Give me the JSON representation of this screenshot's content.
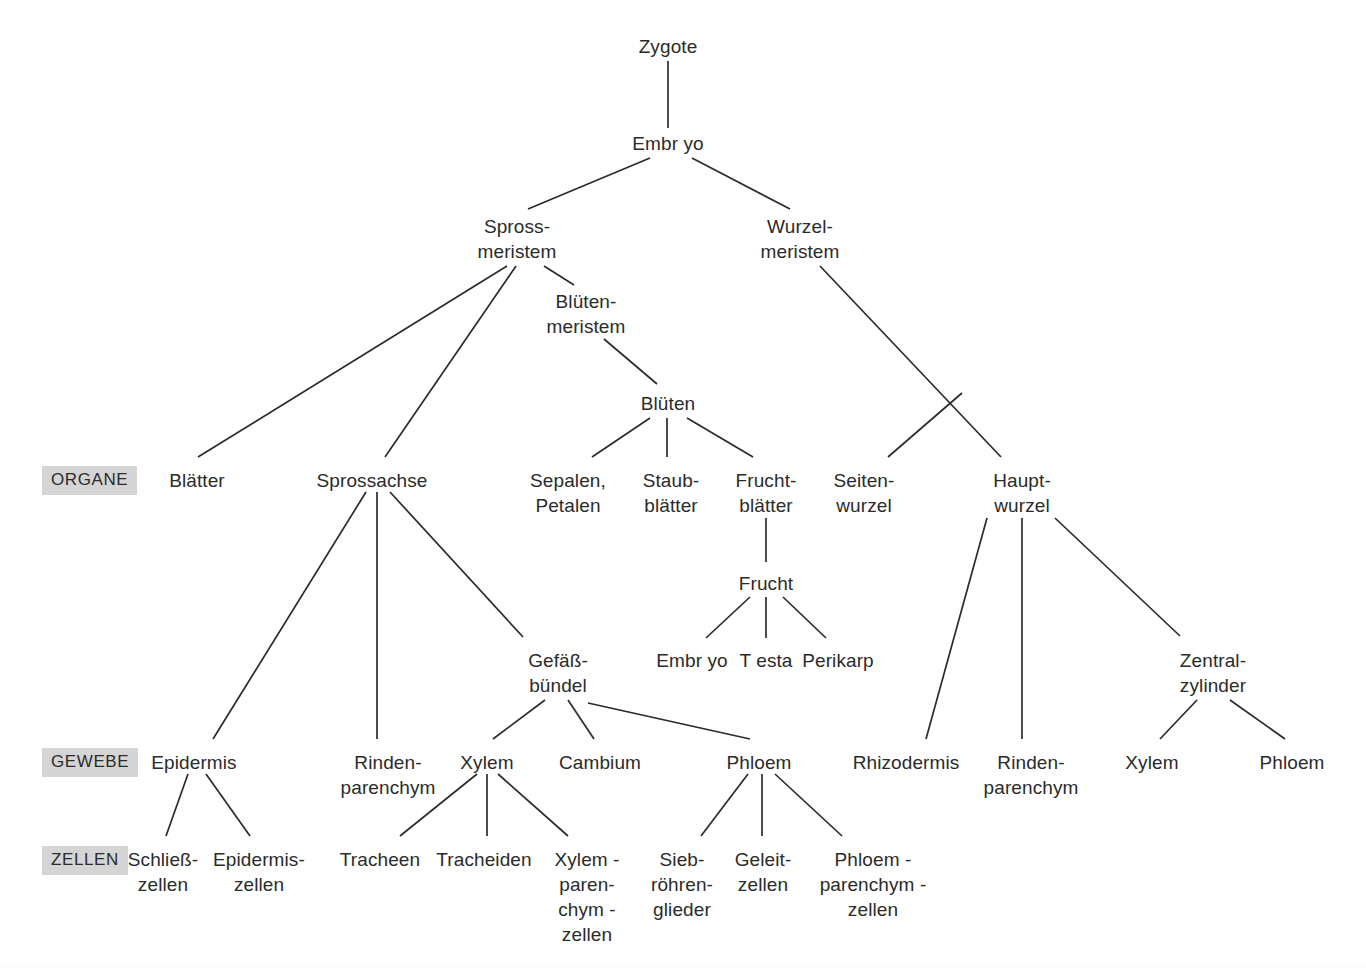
{
  "figure": {
    "background_color": "#ffffff",
    "line_color": "#2b2b2b",
    "text_color": "#2b2b2b",
    "level_label_background": "#d5d5d5"
  },
  "level_labels": [
    {
      "id": "organe",
      "text": "ORGANE",
      "x": 42,
      "y": 466
    },
    {
      "id": "gewebe",
      "text": "GEWEBE",
      "x": 42,
      "y": 748
    },
    {
      "id": "zellen",
      "text": "ZELLEN",
      "x": 42,
      "y": 846
    }
  ],
  "nodes": [
    {
      "id": "zygote",
      "lines": [
        "Zygote"
      ],
      "x": 668,
      "y": 34
    },
    {
      "id": "embryo",
      "lines": [
        "Embr yo"
      ],
      "x": 668,
      "y": 131
    },
    {
      "id": "spross-meristem",
      "lines": [
        "Spross-",
        "meristem"
      ],
      "x": 517,
      "y": 214
    },
    {
      "id": "wurzel-meristem",
      "lines": [
        "Wurzel-",
        "meristem"
      ],
      "x": 800,
      "y": 214
    },
    {
      "id": "blueten-meristem",
      "lines": [
        "Blüten-",
        "meristem"
      ],
      "x": 586,
      "y": 289
    },
    {
      "id": "blueten",
      "lines": [
        "Blüten"
      ],
      "x": 668,
      "y": 391
    },
    {
      "id": "blaetter",
      "lines": [
        "Blätter"
      ],
      "x": 197,
      "y": 468
    },
    {
      "id": "sprossachse",
      "lines": [
        "Sprossachse"
      ],
      "x": 372,
      "y": 468
    },
    {
      "id": "sepalen-petalen",
      "lines": [
        "Sepalen,",
        "Petalen"
      ],
      "x": 568,
      "y": 468
    },
    {
      "id": "staubblaetter",
      "lines": [
        "Staub-",
        "blätter"
      ],
      "x": 671,
      "y": 468
    },
    {
      "id": "fruchtblaetter",
      "lines": [
        "Frucht-",
        "blätter"
      ],
      "x": 766,
      "y": 468
    },
    {
      "id": "seitenwurzel",
      "lines": [
        "Seiten-",
        "wurzel"
      ],
      "x": 864,
      "y": 468
    },
    {
      "id": "hauptwurzel",
      "lines": [
        "Haupt-",
        "wurzel"
      ],
      "x": 1022,
      "y": 468
    },
    {
      "id": "frucht",
      "lines": [
        "Frucht"
      ],
      "x": 766,
      "y": 571
    },
    {
      "id": "gefaessbuendel",
      "lines": [
        "Gefäß-",
        "bündel"
      ],
      "x": 558,
      "y": 648
    },
    {
      "id": "frucht-embryo",
      "lines": [
        "Embr yo"
      ],
      "x": 692,
      "y": 648
    },
    {
      "id": "frucht-testa",
      "lines": [
        "T esta"
      ],
      "x": 766,
      "y": 648
    },
    {
      "id": "frucht-perikarp",
      "lines": [
        "Perikarp"
      ],
      "x": 838,
      "y": 648
    },
    {
      "id": "zentralzylinder",
      "lines": [
        "Zentral-",
        "zylinder"
      ],
      "x": 1213,
      "y": 648
    },
    {
      "id": "epidermis",
      "lines": [
        "Epidermis"
      ],
      "x": 194,
      "y": 750
    },
    {
      "id": "rindenparenchym-spross",
      "lines": [
        "Rinden-",
        "parenchym"
      ],
      "x": 388,
      "y": 750
    },
    {
      "id": "xylem-spross",
      "lines": [
        "Xylem"
      ],
      "x": 487,
      "y": 750
    },
    {
      "id": "cambium",
      "lines": [
        "Cambium"
      ],
      "x": 600,
      "y": 750
    },
    {
      "id": "phloem-spross",
      "lines": [
        "Phloem"
      ],
      "x": 759,
      "y": 750
    },
    {
      "id": "rhizodermis",
      "lines": [
        "Rhizodermis"
      ],
      "x": 906,
      "y": 750
    },
    {
      "id": "rindenparenchym-wurzel",
      "lines": [
        "Rinden-",
        "parenchym"
      ],
      "x": 1031,
      "y": 750
    },
    {
      "id": "xylem-wurzel",
      "lines": [
        "Xylem"
      ],
      "x": 1152,
      "y": 750
    },
    {
      "id": "phloem-wurzel",
      "lines": [
        "Phloem"
      ],
      "x": 1292,
      "y": 750
    },
    {
      "id": "schliesszellen",
      "lines": [
        "Schließ-",
        "zellen"
      ],
      "x": 163,
      "y": 847
    },
    {
      "id": "epidermiszellen",
      "lines": [
        "Epidermis-",
        "zellen"
      ],
      "x": 259,
      "y": 847
    },
    {
      "id": "tracheen",
      "lines": [
        "Tracheen"
      ],
      "x": 380,
      "y": 847
    },
    {
      "id": "tracheiden",
      "lines": [
        "Tracheiden"
      ],
      "x": 484,
      "y": 847
    },
    {
      "id": "xylemparenchymzellen",
      "lines": [
        "Xylem -",
        "paren-",
        "chym -",
        "zellen"
      ],
      "x": 587,
      "y": 847
    },
    {
      "id": "siebroehrenglieder",
      "lines": [
        "Sieb-",
        "röhren-",
        "glieder"
      ],
      "x": 682,
      "y": 847
    },
    {
      "id": "geleitzellen",
      "lines": [
        "Geleit-",
        "zellen"
      ],
      "x": 763,
      "y": 847
    },
    {
      "id": "phloemparenchymzellen",
      "lines": [
        "Phloem -",
        "parenchym -",
        "zellen"
      ],
      "x": 873,
      "y": 847
    }
  ],
  "edges": [
    {
      "id": "zygote-embryo",
      "from": "Zygote",
      "to": "Embryo",
      "x1": 668,
      "y1": 61,
      "x2": 668,
      "y2": 128
    },
    {
      "id": "embryo-sprossmeristem",
      "from": "Embryo",
      "to": "Spross-meristem",
      "x1": 650,
      "y1": 158,
      "x2": 528,
      "y2": 209
    },
    {
      "id": "embryo-wurzelmeristem",
      "from": "Embryo",
      "to": "Wurzel-meristem",
      "x1": 692,
      "y1": 158,
      "x2": 790,
      "y2": 209
    },
    {
      "id": "sprossmeristem-blaetter",
      "from": "Spross-meristem",
      "to": "Blätter",
      "x1": 507,
      "y1": 266,
      "x2": 198,
      "y2": 457
    },
    {
      "id": "sprossmeristem-sprossachse",
      "from": "Spross-meristem",
      "to": "Sprossachse",
      "x1": 516,
      "y1": 266,
      "x2": 385,
      "y2": 457
    },
    {
      "id": "sprossmeristem-bluetenmeristem",
      "from": "Spross-meristem",
      "to": "Blüten-meristem",
      "x1": 544,
      "y1": 266,
      "x2": 574,
      "y2": 285
    },
    {
      "id": "bluetenmeristem-blueten",
      "from": "Blüten-meristem",
      "to": "Blüten",
      "x1": 604,
      "y1": 339,
      "x2": 657,
      "y2": 384
    },
    {
      "id": "blueten-sepalen",
      "from": "Blüten",
      "to": "Sepalen, Petalen",
      "x1": 650,
      "y1": 418,
      "x2": 592,
      "y2": 457
    },
    {
      "id": "blueten-staubblaetter",
      "from": "Blüten",
      "to": "Staubblätter",
      "x1": 667,
      "y1": 418,
      "x2": 667,
      "y2": 457
    },
    {
      "id": "blueten-fruchtblaetter",
      "from": "Blüten",
      "to": "Fruchtblätter",
      "x1": 687,
      "y1": 418,
      "x2": 753,
      "y2": 457
    },
    {
      "id": "wurzelmeristem-hauptwurzel",
      "from": "Wurzel-meristem",
      "to": "Hauptwurzel",
      "x1": 820,
      "y1": 266,
      "x2": 1001,
      "y2": 457
    },
    {
      "id": "branch-seitenwurzel",
      "from": "Wurzel-meristem",
      "to": "Seitenwurzel",
      "x1": 962,
      "y1": 393,
      "x2": 888,
      "y2": 457
    },
    {
      "id": "fruchtblaetter-frucht",
      "from": "Fruchtblätter",
      "to": "Frucht",
      "x1": 766,
      "y1": 518,
      "x2": 766,
      "y2": 562
    },
    {
      "id": "frucht-embryo-edge",
      "from": "Frucht",
      "to": "Embryo",
      "x1": 750,
      "y1": 597,
      "x2": 706,
      "y2": 638
    },
    {
      "id": "frucht-testa-edge",
      "from": "Frucht",
      "to": "Testa",
      "x1": 766,
      "y1": 597,
      "x2": 766,
      "y2": 638
    },
    {
      "id": "frucht-perikarp-edge",
      "from": "Frucht",
      "to": "Perikarp",
      "x1": 783,
      "y1": 597,
      "x2": 826,
      "y2": 638
    },
    {
      "id": "sprossachse-epidermis",
      "from": "Sprossachse",
      "to": "Epidermis",
      "x1": 366,
      "y1": 492,
      "x2": 213,
      "y2": 739
    },
    {
      "id": "sprossachse-rindenparenchym",
      "from": "Sprossachse",
      "to": "Rinden-parenchym",
      "x1": 377,
      "y1": 492,
      "x2": 377,
      "y2": 739
    },
    {
      "id": "sprossachse-gefaessbuendel",
      "from": "Sprossachse",
      "to": "Gefäßbündel",
      "x1": 390,
      "y1": 492,
      "x2": 523,
      "y2": 637
    },
    {
      "id": "gefaessbuendel-xylem",
      "from": "Gefäßbündel",
      "to": "Xylem",
      "x1": 545,
      "y1": 700,
      "x2": 493,
      "y2": 739
    },
    {
      "id": "gefaessbuendel-cambium",
      "from": "Gefäßbündel",
      "to": "Cambium",
      "x1": 568,
      "y1": 700,
      "x2": 594,
      "y2": 739
    },
    {
      "id": "gefaessbuendel-phloem",
      "from": "Gefäßbündel",
      "to": "Phloem",
      "x1": 588,
      "y1": 703,
      "x2": 750,
      "y2": 739
    },
    {
      "id": "epidermis-schliesszellen",
      "from": "Epidermis",
      "to": "Schließzellen",
      "x1": 188,
      "y1": 774,
      "x2": 166,
      "y2": 836
    },
    {
      "id": "epidermis-epidermiszellen",
      "from": "Epidermis",
      "to": "Epidermiszellen",
      "x1": 206,
      "y1": 774,
      "x2": 250,
      "y2": 836
    },
    {
      "id": "xylem-tracheen",
      "from": "Xylem",
      "to": "Tracheen",
      "x1": 477,
      "y1": 774,
      "x2": 400,
      "y2": 836
    },
    {
      "id": "xylem-tracheiden",
      "from": "Xylem",
      "to": "Tracheiden",
      "x1": 487,
      "y1": 774,
      "x2": 487,
      "y2": 836
    },
    {
      "id": "xylem-xylemparenchym",
      "from": "Xylem",
      "to": "Xylemparenchymzellen",
      "x1": 498,
      "y1": 774,
      "x2": 568,
      "y2": 836
    },
    {
      "id": "phloem-siebroehren",
      "from": "Phloem",
      "to": "Siebröhrenglieder",
      "x1": 748,
      "y1": 774,
      "x2": 701,
      "y2": 836
    },
    {
      "id": "phloem-geleitzellen",
      "from": "Phloem",
      "to": "Geleitzellen",
      "x1": 762,
      "y1": 774,
      "x2": 762,
      "y2": 836
    },
    {
      "id": "phloem-phloemparenchym",
      "from": "Phloem",
      "to": "Phloemparenchymzellen",
      "x1": 775,
      "y1": 774,
      "x2": 842,
      "y2": 836
    },
    {
      "id": "hauptwurzel-rhizodermis",
      "from": "Hauptwurzel",
      "to": "Rhizodermis",
      "x1": 987,
      "y1": 518,
      "x2": 926,
      "y2": 739
    },
    {
      "id": "hauptwurzel-rindenparenchym",
      "from": "Hauptwurzel",
      "to": "Rinden-parenchym",
      "x1": 1022,
      "y1": 518,
      "x2": 1022,
      "y2": 739
    },
    {
      "id": "hauptwurzel-zentralzylinder",
      "from": "Hauptwurzel",
      "to": "Zentralzylinder",
      "x1": 1055,
      "y1": 518,
      "x2": 1180,
      "y2": 636
    },
    {
      "id": "zentralzylinder-xylem",
      "from": "Zentralzylinder",
      "to": "Xylem",
      "x1": 1197,
      "y1": 700,
      "x2": 1160,
      "y2": 739
    },
    {
      "id": "zentralzylinder-phloem",
      "from": "Zentralzylinder",
      "to": "Phloem",
      "x1": 1230,
      "y1": 700,
      "x2": 1285,
      "y2": 739
    }
  ]
}
